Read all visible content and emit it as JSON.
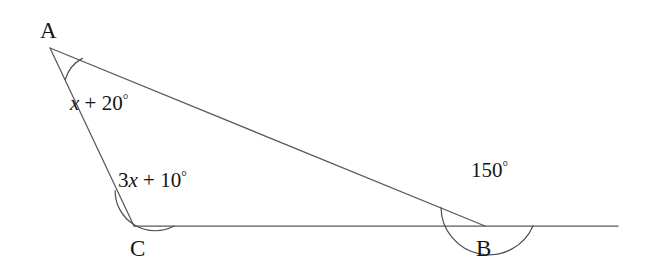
{
  "figure": {
    "name": "triangle-angle-diagram",
    "background_color": "#ffffff",
    "line_color": "#555a5f",
    "text_color": "#141414"
  },
  "vertices": [
    {
      "id": "A",
      "label": "A",
      "x": 50,
      "y": 48,
      "label_x": 40,
      "label_y": 38
    },
    {
      "id": "C",
      "label": "C",
      "x": 134,
      "y": 226,
      "label_x": 130,
      "label_y": 256
    },
    {
      "id": "B",
      "label": "B",
      "x": 485,
      "y": 226,
      "label_x": 476,
      "label_y": 256
    }
  ],
  "angles": [
    {
      "at": "A",
      "prefix": "",
      "coefficient": "",
      "variable": "x",
      "operator": " + ",
      "constant": "20",
      "unit": "°",
      "full_text": "x + 20°",
      "arc_radius": 35,
      "label_x": 70,
      "label_y": 110
    },
    {
      "at": "C",
      "prefix": "3",
      "coefficient": "3",
      "variable": "x",
      "operator": " + ",
      "constant": "10",
      "unit": "°",
      "full_text": "3x + 10°",
      "arc_radius": 40,
      "label_x": 118,
      "label_y": 187
    },
    {
      "at": "B",
      "prefix": "",
      "coefficient": "",
      "variable": "",
      "operator": "",
      "constant": "150",
      "unit": "°",
      "full_text": "150°",
      "arc_radius": 48,
      "label_x": 471,
      "label_y": 177
    }
  ],
  "segments": [
    {
      "name": "segment-A-C",
      "from": "A",
      "to": "C"
    },
    {
      "name": "segment-A-B",
      "from": "A",
      "to": "B"
    },
    {
      "name": "baseline-C-B-extended",
      "from": "C",
      "to": "extension-right"
    }
  ],
  "baseline": {
    "start_x": 134,
    "end_x": 618,
    "y": 226
  }
}
